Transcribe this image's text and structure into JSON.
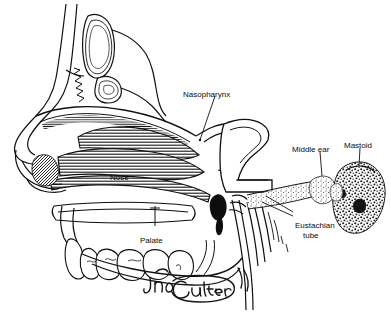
{
  "figure": {
    "background_color": "#ffffff",
    "ink_color": "#101010",
    "artist_signature": "Jon Coulter"
  },
  "labels": {
    "nasopharynx": "Nasopharynx",
    "nose": "Nose",
    "palate": "Palate",
    "middle_ear": "Middle ear",
    "mastoid": "Mastoid",
    "eustachian_tube_line1": "Eustachian",
    "eustachian_tube_line2": "tube"
  },
  "structures": [
    {
      "name": "frontal-sinus",
      "description": "upper elongated sinus cavity"
    },
    {
      "name": "sphenoid-sinus",
      "description": "small rounded sinus cavity"
    },
    {
      "name": "nasal-turbinates",
      "description": "hatched scroll-like shelves in nasal cavity"
    },
    {
      "name": "nasal-tip",
      "description": "nose external profile with shaded vestibule"
    },
    {
      "name": "hard-palate",
      "description": "horizontal bony shelf above teeth"
    },
    {
      "name": "teeth",
      "description": "row of upper teeth"
    },
    {
      "name": "tongue",
      "description": "curved mass in oral cavity"
    },
    {
      "name": "pharynx",
      "description": "dark throat passage with vertical striations"
    },
    {
      "name": "eustachian-tube",
      "description": "stippled tapering channel to middle ear"
    },
    {
      "name": "middle-ear",
      "description": "small stippled bulb"
    },
    {
      "name": "mastoid",
      "description": "large mottled irregular bone mass"
    }
  ]
}
